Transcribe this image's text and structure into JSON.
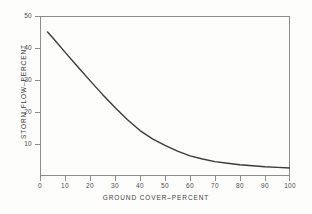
{
  "chart_data": {
    "type": "line",
    "title": "",
    "subtitle": "",
    "xlabel": "GROUND COVER–PERCENT",
    "ylabel": "STORM FLOW–PERCENT",
    "xlim": [
      0,
      100
    ],
    "ylim": [
      0,
      50
    ],
    "xticks": [
      0,
      10,
      20,
      30,
      40,
      50,
      60,
      70,
      80,
      90,
      100
    ],
    "xtick_labels": [
      "0",
      "10",
      "20",
      "30",
      "40",
      "50",
      "60",
      "70",
      "80",
      "90",
      "100"
    ],
    "yticks": [
      10,
      20,
      30,
      40,
      50
    ],
    "ytick_labels": [
      "10",
      "20",
      "30",
      "40",
      "50"
    ],
    "grid": false,
    "legend": null,
    "annotations": [],
    "line_color": "#3a3a3a",
    "line_width": 1.4,
    "frame_color": "#8d8d8d",
    "background_color": "#fdfdfc",
    "series": [
      {
        "name": "storm flow vs ground cover",
        "x": [
          3,
          5,
          10,
          15,
          20,
          25,
          30,
          35,
          40,
          45,
          50,
          55,
          60,
          65,
          70,
          75,
          80,
          85,
          90,
          95,
          100
        ],
        "y": [
          45.0,
          43.3,
          38.7,
          34.2,
          29.8,
          25.5,
          21.4,
          17.6,
          14.2,
          11.6,
          9.6,
          7.8,
          6.3,
          5.3,
          4.5,
          4.0,
          3.5,
          3.2,
          2.9,
          2.7,
          2.5
        ]
      }
    ]
  },
  "axes": {
    "x_tick_labels": [
      "0",
      "10",
      "20",
      "30",
      "40",
      "50",
      "60",
      "70",
      "80",
      "90",
      "100"
    ],
    "y_tick_labels": [
      "10",
      "20",
      "30",
      "40",
      "50"
    ],
    "x_title": "GROUND COVER–PERCENT",
    "y_title": "STORM FLOW–PERCENT"
  }
}
